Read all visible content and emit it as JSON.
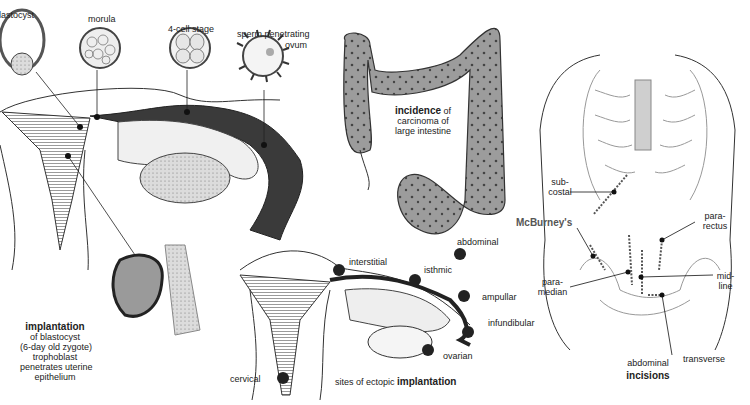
{
  "panels": {
    "fertilization": {
      "stages": [
        {
          "label": "blastocyst"
        },
        {
          "label": "morula"
        },
        {
          "label": "4-cell stage"
        },
        {
          "label": "sperm penetrating"
        },
        {
          "label": "ovum"
        }
      ],
      "caption": {
        "title": "implantation",
        "lines": [
          "of blastocyst",
          "(6-day old zygote)",
          "trophoblast",
          "penetrates uterine",
          "epithelium"
        ]
      }
    },
    "colon": {
      "caption_bold": "incidence",
      "caption_rest": " of",
      "caption_lines": [
        "carcinoma of",
        "large intestine"
      ]
    },
    "ectopic": {
      "sites": [
        {
          "label": "abdominal"
        },
        {
          "label": "interstitial"
        },
        {
          "label": "isthmic"
        },
        {
          "label": "ampullar"
        },
        {
          "label": "infundibular"
        },
        {
          "label": "ovarian"
        },
        {
          "label": "cervical"
        }
      ],
      "caption_prefix": "sites of ectopic ",
      "caption_bold": "implantation"
    },
    "incisions": {
      "labels": [
        {
          "label": "sub-",
          "label2": "costal"
        },
        {
          "label": "McBurney's"
        },
        {
          "label": "para-",
          "label2": "rectus"
        },
        {
          "label": "para-",
          "label2": "median"
        },
        {
          "label": "mid-",
          "label2": "line"
        },
        {
          "label": "transverse"
        }
      ],
      "caption_top": "abdominal",
      "caption_bold": "incisions"
    }
  },
  "colors": {
    "ink": "#222222",
    "tissue_grey": "#9a9a9a",
    "dark_tube": "#3a3a3a",
    "background": "#ffffff"
  }
}
